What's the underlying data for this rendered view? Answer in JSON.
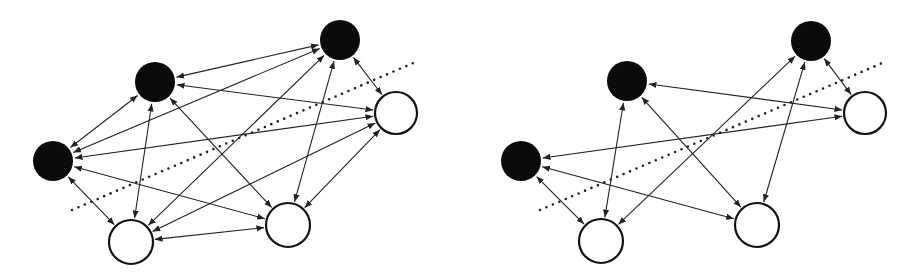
{
  "colors": {
    "edge": "#222222",
    "black_node": "#0a0a0a",
    "white_node": "#ffffff",
    "divider": "#222222"
  },
  "graphs": [
    {
      "name": "left-graph",
      "nodes": [
        {
          "id": "A",
          "x": 340,
          "y": 40,
          "r": 20,
          "fill": "black"
        },
        {
          "id": "B",
          "x": 155,
          "y": 82,
          "r": 20,
          "fill": "black"
        },
        {
          "id": "C",
          "x": 53,
          "y": 161,
          "r": 20,
          "fill": "black"
        },
        {
          "id": "D",
          "x": 396,
          "y": 113,
          "r": 21,
          "fill": "white"
        },
        {
          "id": "E",
          "x": 288,
          "y": 225,
          "r": 22,
          "fill": "white"
        },
        {
          "id": "F",
          "x": 131,
          "y": 242,
          "r": 22,
          "fill": "white"
        }
      ],
      "edges": [
        [
          "A",
          "B"
        ],
        [
          "A",
          "D"
        ],
        [
          "A",
          "C"
        ],
        [
          "A",
          "F"
        ],
        [
          "A",
          "E"
        ],
        [
          "B",
          "C"
        ],
        [
          "B",
          "D"
        ],
        [
          "B",
          "E"
        ],
        [
          "B",
          "F"
        ],
        [
          "C",
          "D"
        ],
        [
          "C",
          "E"
        ],
        [
          "C",
          "F"
        ],
        [
          "D",
          "E"
        ],
        [
          "D",
          "F"
        ],
        [
          "E",
          "F"
        ]
      ],
      "divider": {
        "x1": 72,
        "y1": 210,
        "x2": 418,
        "y2": 61
      }
    },
    {
      "name": "right-graph",
      "nodes": [
        {
          "id": "A",
          "x": 811,
          "y": 41,
          "r": 20,
          "fill": "black"
        },
        {
          "id": "B",
          "x": 627,
          "y": 81,
          "r": 20,
          "fill": "black"
        },
        {
          "id": "C",
          "x": 521,
          "y": 161,
          "r": 20,
          "fill": "black"
        },
        {
          "id": "D",
          "x": 865,
          "y": 113,
          "r": 21,
          "fill": "white"
        },
        {
          "id": "E",
          "x": 757,
          "y": 225,
          "r": 22,
          "fill": "white"
        },
        {
          "id": "F",
          "x": 601,
          "y": 241,
          "r": 22,
          "fill": "white"
        }
      ],
      "edges": [
        [
          "A",
          "D"
        ],
        [
          "B",
          "D"
        ],
        [
          "B",
          "E"
        ],
        [
          "B",
          "F"
        ],
        [
          "A",
          "F"
        ],
        [
          "A",
          "E"
        ],
        [
          "C",
          "D"
        ],
        [
          "C",
          "E"
        ],
        [
          "C",
          "F"
        ]
      ],
      "divider": {
        "x1": 540,
        "y1": 210,
        "x2": 887,
        "y2": 61
      }
    }
  ]
}
